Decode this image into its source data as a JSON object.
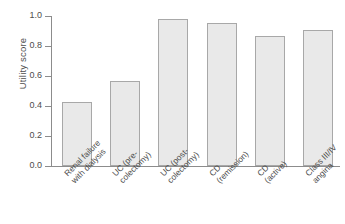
{
  "chart_data": {
    "type": "bar",
    "title": "",
    "xlabel": "",
    "ylabel": "Utility score",
    "ylim": [
      0.0,
      1.0
    ],
    "grid": false,
    "legend": false,
    "categories": [
      "Renal failure\nwith dialysis",
      "UC (pre-\ncolectomy)",
      "UC (post-\ncolectomy)",
      "CD\n(remission)",
      "CD\n(active)",
      "Class III/IV\nangina"
    ],
    "values": [
      0.43,
      0.57,
      0.98,
      0.955,
      0.87,
      0.91
    ],
    "ytick_labels": [
      "1.0",
      "0.8",
      "0.6",
      "0.4",
      "0.2",
      "0.0"
    ],
    "ytick_values": [
      1.0,
      0.8,
      0.6,
      0.4,
      0.2,
      0.0
    ],
    "colors": {
      "bar_fill": "#e9e9e9",
      "bar_border": "#a8a8a8",
      "axis": "#8c8c8c",
      "text": "#4d4d4d",
      "background": "#ffffff"
    }
  }
}
